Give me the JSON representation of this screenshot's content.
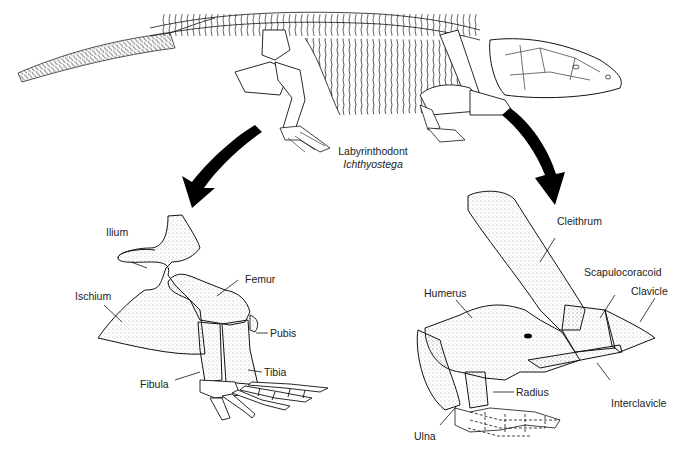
{
  "figure": {
    "caption": {
      "group": "Labyrinthodont",
      "species": "Ichthyostega"
    },
    "hindlimb_labels": {
      "ilium": "Ilium",
      "ischium": "Ischium",
      "femur": "Femur",
      "pubis": "Pubis",
      "tibia": "Tibia",
      "fibula": "Fibula"
    },
    "forelimb_labels": {
      "cleithrum": "Cleithrum",
      "scapulocoracoid": "Scapulocoracoid",
      "clavicle": "Clavicle",
      "humerus": "Humerus",
      "radius": "Radius",
      "interclavicle": "Interclavicle",
      "ulna": "Ulna"
    },
    "icons": {
      "left_arrow": "curved-arrow-down-left",
      "right_arrow": "curved-arrow-down-right"
    },
    "colors": {
      "ink": "#111111",
      "background": "#ffffff"
    }
  }
}
